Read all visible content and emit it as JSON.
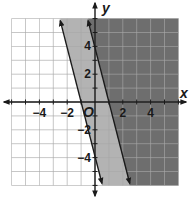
{
  "chart_data": {
    "type": "inequality-graph",
    "title": "",
    "xlabel": "x",
    "ylabel": "y",
    "origin_label": "O",
    "xlim": [
      -6,
      6
    ],
    "ylim": [
      -6,
      6
    ],
    "grid": true,
    "grid_step": 1,
    "x_tick_labels": [
      {
        "value": -4,
        "label": "−4"
      },
      {
        "value": -2,
        "label": "−2"
      },
      {
        "value": 2,
        "label": "2"
      },
      {
        "value": 4,
        "label": "4"
      }
    ],
    "y_tick_labels": [
      {
        "value": 4,
        "label": "4"
      },
      {
        "value": 2,
        "label": "2"
      },
      {
        "value": -2,
        "label": "−2"
      },
      {
        "value": -4,
        "label": "−4"
      }
    ],
    "lines": [
      {
        "name": "boundary-left",
        "equation": "y = -4x - 4",
        "slope": -4,
        "intercept": -4,
        "style": "solid",
        "x_intercept": -1
      },
      {
        "name": "boundary-right",
        "equation": "y = -4x + 4",
        "slope": -4,
        "intercept": 4,
        "style": "solid",
        "x_intercept": 1
      }
    ],
    "regions": [
      {
        "name": "light-shade",
        "inequality": "y >= -4x - 4",
        "color": "#b3b3b3"
      },
      {
        "name": "dark-shade",
        "inequality": "y >= -4x + 4",
        "color": "#6e6e6e"
      }
    ]
  },
  "colors": {
    "grid": "#9a9a9a",
    "grid_dark": "#8a8a8a",
    "axis": "#1a1a1a",
    "light": "#b3b3b3",
    "dark": "#6e6e6e"
  }
}
